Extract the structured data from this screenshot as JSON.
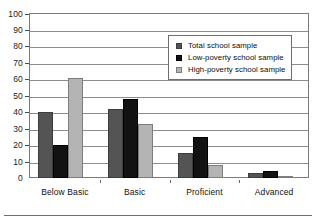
{
  "chart_data": {
    "type": "bar",
    "title": "",
    "subtitle": "",
    "xlabel": "",
    "ylabel": "",
    "ylim": [
      0,
      100
    ],
    "ytick_step": 10,
    "yticks": [
      100,
      90,
      80,
      70,
      60,
      50,
      40,
      30,
      20,
      10,
      0
    ],
    "grid": "horizontal",
    "legend_position": "upper-right-inside",
    "categories": [
      "Below Basic",
      "Basic",
      "Proficient",
      "Advanced"
    ],
    "series": [
      {
        "name": "Total school sample",
        "color": "#545454",
        "values": [
          40,
          42,
          15,
          3
        ]
      },
      {
        "name": "Low-poverty school sample",
        "color": "#121212",
        "values": [
          20,
          48,
          25,
          4
        ]
      },
      {
        "name": "High-poverty school sample",
        "color": "#b4b4b4",
        "values": [
          61,
          33,
          8,
          1
        ]
      }
    ]
  },
  "legend": {
    "items": [
      {
        "label": "Total school sample",
        "swatch": "dark-gray-square"
      },
      {
        "label": "Low-poverty school sample",
        "swatch": "black-square"
      },
      {
        "label": "High-poverty school sample",
        "swatch": "light-gray-square"
      }
    ]
  },
  "axes": {
    "y": {
      "labels": [
        "100",
        "90",
        "80",
        "70",
        "60",
        "50",
        "40",
        "30",
        "20",
        "10",
        "0"
      ]
    },
    "x": {
      "labels": [
        "Below Basic",
        "Basic",
        "Proficient",
        "Advanced"
      ]
    }
  }
}
